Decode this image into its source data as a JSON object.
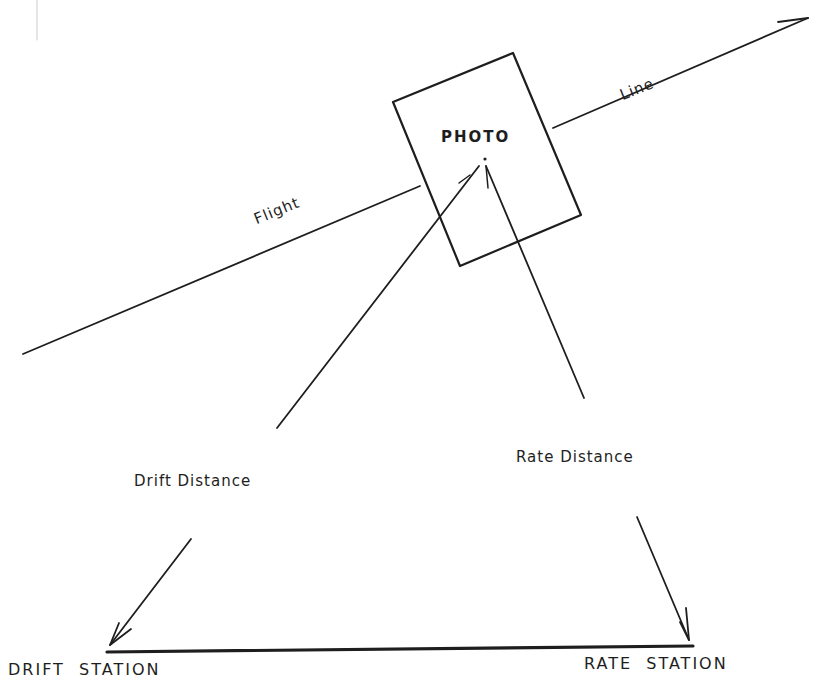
{
  "diagram": {
    "labels": {
      "photo": "PHOTO",
      "flight": "Flight",
      "line": "Line",
      "drift_distance": "Drift Distance",
      "rate_distance": "Rate Distance",
      "drift_station": "DRIFT  STATION",
      "rate_station": "RATE  STATION"
    },
    "colors": {
      "ink": "#1e1e1e",
      "background": "#ffffff"
    }
  }
}
